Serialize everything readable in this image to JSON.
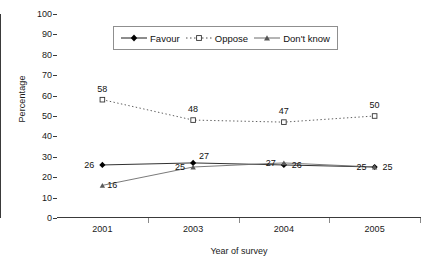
{
  "chart_data": {
    "type": "line",
    "title": "",
    "xlabel": "Year of survey",
    "ylabel": "Percentage",
    "categories": [
      "2001",
      "2003",
      "2004",
      "2005"
    ],
    "ylim": [
      0,
      100
    ],
    "ytick_step": 10,
    "yticks": [
      "100",
      "90",
      "80",
      "70",
      "60",
      "50",
      "40",
      "30",
      "20",
      "10",
      "0"
    ],
    "grid": false,
    "legend_position": "top-center",
    "series": [
      {
        "name": "Favour",
        "values": [
          26,
          27,
          26,
          25
        ],
        "marker": "filled-diamond",
        "line_style": "solid",
        "color": "#1a1a1a",
        "point_labels": [
          "26",
          "27",
          "26",
          "25"
        ],
        "label_side": [
          "left",
          "right",
          "right",
          "right"
        ]
      },
      {
        "name": "Oppose",
        "values": [
          58,
          48,
          47,
          50
        ],
        "marker": "open-square",
        "line_style": "dotted",
        "color": "#4d4d4d",
        "point_labels": [
          "58",
          "48",
          "47",
          "50"
        ],
        "label_side": [
          "above",
          "above",
          "above",
          "above"
        ]
      },
      {
        "name": "Don't know",
        "values": [
          16,
          25,
          27,
          25
        ],
        "marker": "small-triangle",
        "line_style": "solid",
        "color": "#6b6b6b",
        "point_labels": [
          "16",
          "25",
          "27",
          "25"
        ],
        "label_side": [
          "right",
          "left",
          "left",
          "left"
        ]
      }
    ]
  },
  "axes": {
    "y_title": "Percentage",
    "x_title": "Year of survey"
  },
  "legend": {
    "entries": [
      {
        "label": "Favour"
      },
      {
        "label": "Oppose"
      },
      {
        "label": "Don't know"
      }
    ]
  }
}
